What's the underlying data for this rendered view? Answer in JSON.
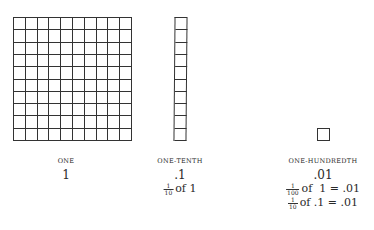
{
  "figures": [
    {
      "id": "one",
      "grid": {
        "rows": 10,
        "cols": 10
      },
      "caption": "ONE",
      "value": "1",
      "expressions": []
    },
    {
      "id": "tenth",
      "grid": {
        "rows": 10,
        "cols": 1
      },
      "caption": "ONE-TENTH",
      "value": ".1",
      "expressions": [
        {
          "num": "1",
          "den": "10",
          "text": "of 1"
        }
      ]
    },
    {
      "id": "hundredth",
      "grid": {
        "rows": 1,
        "cols": 1
      },
      "caption": "ONE-HUNDREDTH",
      "value": ".01",
      "expressions": [
        {
          "num": "1",
          "den": "100",
          "text": "of  1 = .01"
        },
        {
          "num": "1",
          "den": "10",
          "text": "of .1 = .01"
        }
      ]
    }
  ],
  "colors": {
    "line": "#333333",
    "text": "#2a2a2a",
    "background": "#ffffff"
  }
}
